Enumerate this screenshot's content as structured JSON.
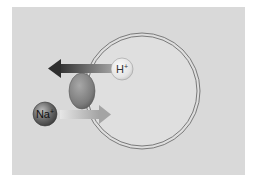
{
  "diagram": {
    "title": "",
    "background_color": "#d9d9d9",
    "cell": {
      "shape": "circle",
      "membrane": "double-line",
      "center": [
        142,
        91
      ],
      "radius": 58,
      "fill": "#dddddd",
      "stroke": "#7a7a7a"
    },
    "transporter": {
      "shape": "ellipse",
      "center": [
        82,
        91
      ],
      "rx": 13,
      "ry": 18,
      "color": "#7c7c7c"
    },
    "ions": [
      {
        "id": "h",
        "symbol": "H",
        "charge": "+",
        "center": [
          122,
          69
        ],
        "radius": 11,
        "color": "#e6e6e6"
      },
      {
        "id": "na",
        "symbol": "Na",
        "charge": "+",
        "center": [
          45,
          114
        ],
        "radius": 12,
        "color": "#6a6a6a"
      }
    ],
    "arrows": [
      {
        "id": "h-efflux",
        "from": [
          112,
          68
        ],
        "to": [
          48,
          68
        ],
        "direction": "out",
        "ion": "H+",
        "color_start": "#9a9a9a",
        "color_end": "#3a3a3a"
      },
      {
        "id": "na-influx",
        "from": [
          60,
          114
        ],
        "to": [
          111,
          114
        ],
        "direction": "in",
        "ion": "Na+",
        "color_start": "#e4e4e4",
        "color_end": "#a6a6a6"
      }
    ],
    "labels": {
      "h_symbol": "H",
      "h_charge": "+",
      "na_symbol": "Na",
      "na_charge": "+"
    }
  }
}
